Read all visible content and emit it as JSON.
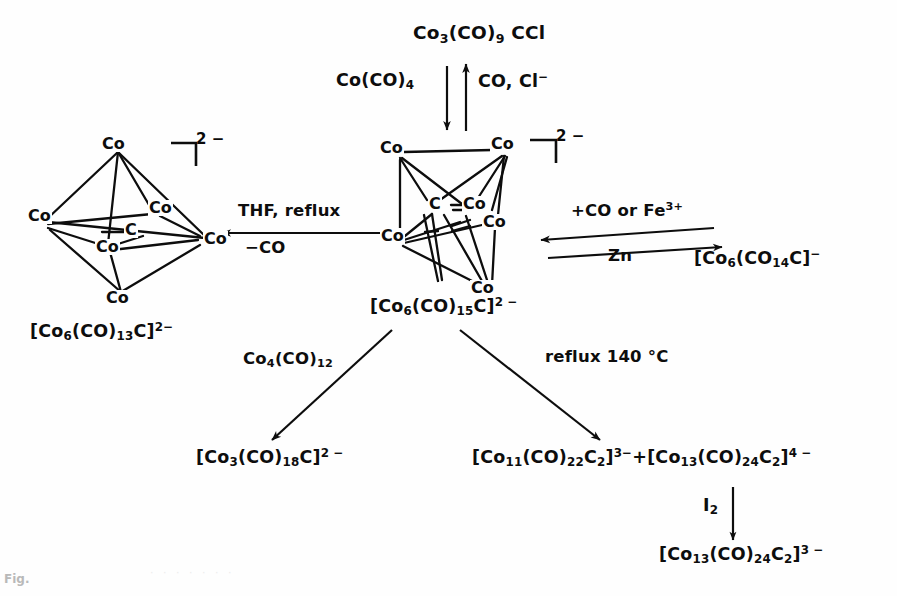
{
  "figure": {
    "caption": "Fig.",
    "ink_color": "#0d0d0d",
    "background_color": "#fefefe"
  },
  "species": {
    "top_reagent": {
      "formula_html": "Co<sub>3</sub>(CO)<sub>9</sub> CCl",
      "plain": "Co3(CO)9CCl"
    },
    "center_cluster_formula": {
      "formula_html": "[Co<sub>6</sub>(CO)<sub>15</sub>C]<sup>2 −</sup>",
      "plain": "[Co6(CO)15C]2-"
    },
    "left_cluster_formula": {
      "formula_html": "[Co<sub>6</sub>(CO)<sub>13</sub>C]<sup>2−</sup>",
      "plain": "[Co6(CO)13C]2-"
    },
    "right_product": {
      "formula_html": "[Co<sub>6</sub>(CO<sub>14</sub>C]<sup>−</sup>",
      "plain": "[Co6(CO14C]-"
    },
    "bottom_left_product": {
      "formula_html": "[Co<sub>3</sub>(CO)<sub>18</sub>C]<sup>2 −</sup>",
      "plain": "[Co3(CO)18C]2-"
    },
    "bottom_right_products": {
      "formula_html": "[Co<sub>11</sub>(CO)<sub>22</sub>C<sub>2</sub>]<sup>3−</sup>+[Co<sub>13</sub>(CO)<sub>24</sub>C<sub>2</sub>]<sup>4 −</sup>",
      "plain": "[Co11(CO)22C2]3- + [Co13(CO)24C2]4-"
    },
    "final_product": {
      "formula_html": "[Co<sub>13</sub>(CO)<sub>24</sub>C<sub>2</sub>]<sup>3 −</sup>",
      "plain": "[Co13(CO)24C2]3-"
    }
  },
  "reagents": {
    "down_arrow_label": {
      "formula_html": "Co(CO)<sub>4</sub>",
      "plain": "Co(CO)4"
    },
    "up_arrow_label": {
      "formula_html": "CO, Cl<sup>−</sup>",
      "plain": "CO, Cl-"
    },
    "left_arrow_top": "THF, reflux",
    "left_arrow_bottom": "−CO",
    "right_arrow_top": {
      "formula_html": "+CO or Fe<sup>3+</sup>",
      "plain": "+CO or Fe3+"
    },
    "right_arrow_bottom": "Zn",
    "bottom_left_arrow_label": {
      "formula_html": "Co<sub>4</sub>(CO)<sub>12</sub>",
      "plain": "Co4(CO)12"
    },
    "bottom_right_arrow_label": "reflux 140 °C",
    "iodine_arrow_label": {
      "formula_html": "I<sub>2</sub>",
      "plain": "I2"
    }
  },
  "clusters": {
    "left": {
      "name": "octahedral-co6-carbide-cluster",
      "charge_label": "2 −",
      "vertices": [
        "Co",
        "Co",
        "Co",
        "Co",
        "Co",
        "Co"
      ],
      "interstitial_atom": "C"
    },
    "center": {
      "name": "trigonal-prismatic-co6-carbide-cluster",
      "charge_label": "2 −",
      "vertices": [
        "Co",
        "Co",
        "Co",
        "Co",
        "Co",
        "Co"
      ],
      "interstitial_atom": "C"
    }
  }
}
